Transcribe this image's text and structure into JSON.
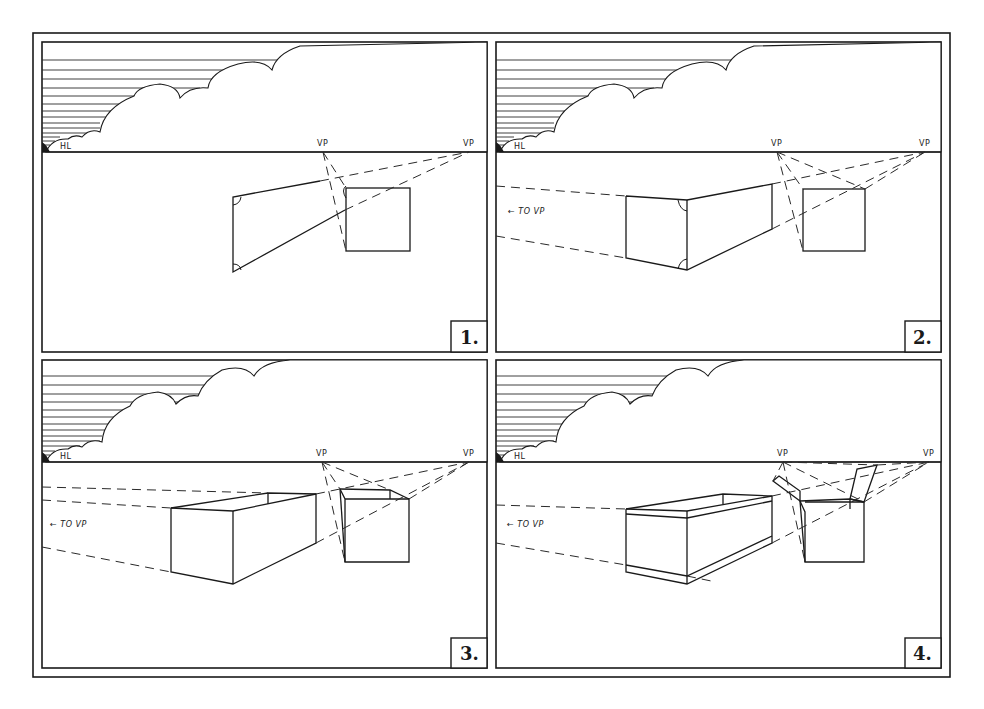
{
  "colors": {
    "ink": "#1a1a1a",
    "paper": "#ffffff"
  },
  "frame": {
    "outer": [
      33,
      33,
      950,
      677
    ]
  },
  "panels": [
    {
      "id": "1",
      "number_label": "1.",
      "rect": [
        42,
        42,
        487,
        352
      ],
      "horizon_y": 152,
      "hl_label": "HL",
      "vp_left_label": "VP",
      "vp_right_label": "VP",
      "vp_left": [
        323,
        152
      ],
      "vp_right": [
        469,
        152
      ],
      "to_vp_label": ""
    },
    {
      "id": "2",
      "number_label": "2.",
      "rect": [
        496,
        42,
        941,
        352
      ],
      "horizon_y": 152,
      "hl_label": "HL",
      "vp_left_label": "VP",
      "vp_right_label": "VP",
      "vp_left": [
        777,
        152
      ],
      "vp_right": [
        925,
        152
      ],
      "to_vp_label": "← TO VP"
    },
    {
      "id": "3",
      "number_label": "3.",
      "rect": [
        42,
        360,
        487,
        668
      ],
      "horizon_y": 462,
      "hl_label": "HL",
      "vp_left_label": "VP",
      "vp_right_label": "VP",
      "vp_left": [
        322,
        462
      ],
      "vp_right": [
        469,
        462
      ],
      "to_vp_label": "← TO VP"
    },
    {
      "id": "4",
      "number_label": "4.",
      "rect": [
        496,
        360,
        941,
        668
      ],
      "horizon_y": 462,
      "hl_label": "HL",
      "vp_left_label": "VP",
      "vp_right_label": "VP",
      "vp_left": [
        783,
        462
      ],
      "vp_right": [
        929,
        462
      ],
      "to_vp_label": "← TO VP"
    }
  ]
}
